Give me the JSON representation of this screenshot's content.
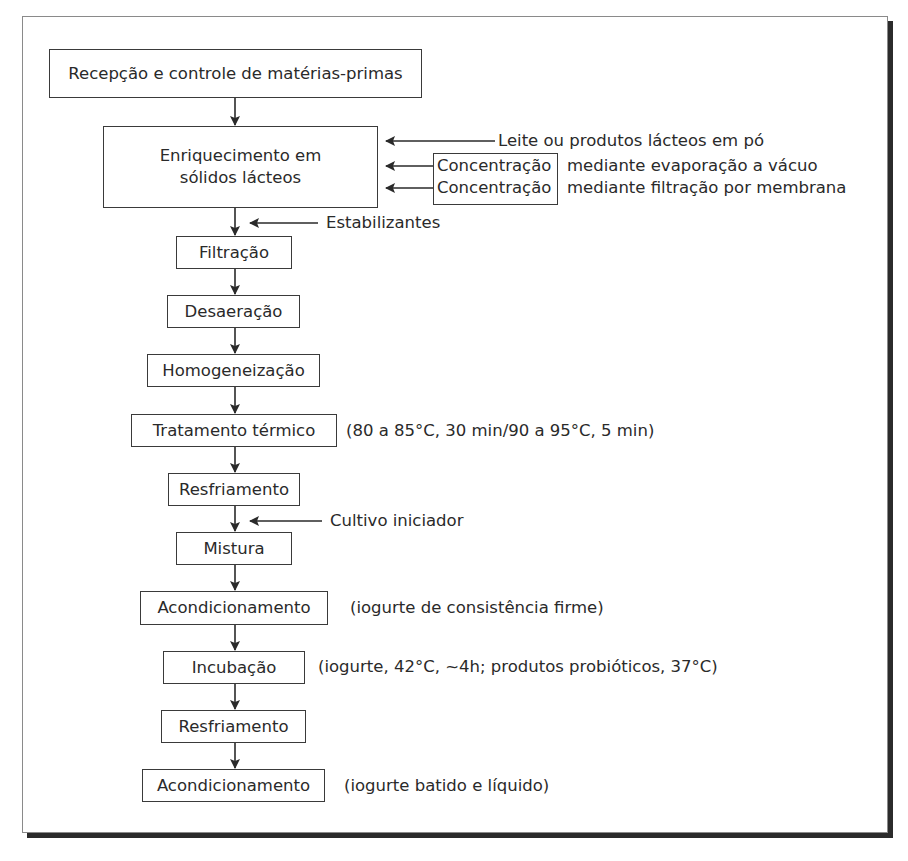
{
  "diagram": {
    "type": "flowchart",
    "steps": [
      {
        "id": "s1",
        "label": "Recepção e controle de matérias-primas"
      },
      {
        "id": "s2",
        "label_line1": "Enriquecimento em",
        "label_line2": "sólidos lácteos"
      },
      {
        "id": "s3",
        "label": "Filtração"
      },
      {
        "id": "s4",
        "label": "Desaeração"
      },
      {
        "id": "s5",
        "label": "Homogeneização"
      },
      {
        "id": "s6",
        "label": "Tratamento térmico",
        "note": "(80 a 85°C, 30 min/90 a 95°C, 5 min)"
      },
      {
        "id": "s7",
        "label": "Resfriamento"
      },
      {
        "id": "s8",
        "label": "Mistura"
      },
      {
        "id": "s9",
        "label": "Acondicionamento",
        "note": "(iogurte de consistência firme)"
      },
      {
        "id": "s10",
        "label": "Incubação",
        "note": "(iogurte, 42°C, ~4h; produtos probióticos, 37°C)"
      },
      {
        "id": "s11",
        "label": "Resfriamento"
      },
      {
        "id": "s12",
        "label": "Acondicionamento",
        "note": "(iogurte batido e líquido)"
      }
    ],
    "inputs": {
      "enrichment": [
        {
          "label": "Leite ou produtos lácteos em pó"
        },
        {
          "box_label": "Concentração",
          "detail": "mediante evaporação a vácuo"
        },
        {
          "box_label": "Concentração",
          "detail": "mediante filtração por membrana"
        }
      ],
      "stabilizers": "Estabilizantes",
      "starter_culture": "Cultivo iniciador"
    },
    "colors": {
      "line": "#2a2a2a",
      "border": "#3a3a3a",
      "shadow": "#2b2b2b",
      "background": "#ffffff"
    }
  }
}
